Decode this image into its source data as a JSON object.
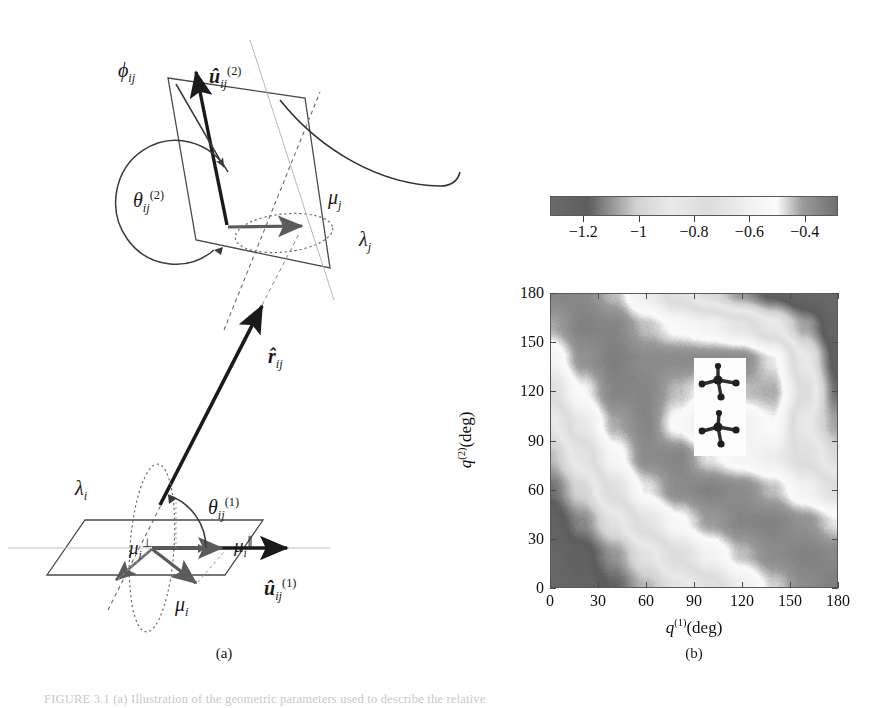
{
  "figure": {
    "panels": [
      {
        "key": "a",
        "label": "(a)",
        "type": "vector-diagram"
      },
      {
        "key": "b",
        "label": "(b)",
        "type": "heatmap"
      }
    ],
    "caption": "FIGURE 3.1  (a) Illustration of the geometric parameters used to describe the relative"
  },
  "panel_a": {
    "label": "(a)",
    "annotations": [
      {
        "name": "phi-ij",
        "text": "ϕ",
        "sub": "ij",
        "sup": "",
        "x": 118,
        "y": 59
      },
      {
        "name": "u-hat-2",
        "text": "û",
        "sub": "ij",
        "sup": "(2)",
        "x": 209,
        "y": 64
      },
      {
        "name": "theta-ij-2",
        "text": "θ",
        "sub": "ij",
        "sup": "(2)",
        "x": 133,
        "y": 188
      },
      {
        "name": "mu-j",
        "text": "μ",
        "sub": "j",
        "sup": "",
        "x": 328,
        "y": 186
      },
      {
        "name": "lambda-j",
        "text": "λ",
        "sub": "j",
        "sup": "",
        "x": 359,
        "y": 228
      },
      {
        "name": "r-hat-ij",
        "text": "r̂",
        "sub": "ij",
        "sup": "",
        "x": 268,
        "y": 345
      },
      {
        "name": "lambda-i",
        "text": "λ",
        "sub": "i",
        "sup": "",
        "x": 75,
        "y": 477
      },
      {
        "name": "theta-ij-1",
        "text": "θ",
        "sub": "ij",
        "sup": "(1)",
        "x": 208,
        "y": 495
      },
      {
        "name": "mu-i-perp",
        "text": "μ",
        "sub": "i",
        "sup": "⊥",
        "x": 129,
        "y": 536
      },
      {
        "name": "mu-i-par",
        "text": "μ",
        "sub": "i",
        "sup": "∥",
        "x": 234,
        "y": 534
      },
      {
        "name": "mu-i",
        "text": "μ",
        "sub": "i",
        "sup": "",
        "x": 175,
        "y": 593
      },
      {
        "name": "u-hat-1",
        "text": "û",
        "sub": "ij",
        "sup": "(1)",
        "x": 264,
        "y": 576
      }
    ]
  },
  "panel_b": {
    "label": "(b)",
    "colorbar": {
      "name": "energy-colorbar",
      "ticks": [
        -1.2,
        -1,
        -0.8,
        -0.6,
        -0.4
      ],
      "tick_labels": [
        "−1.2",
        "−1",
        "−0.8",
        "−0.6",
        "−0.4"
      ],
      "vmin": -1.32,
      "vmax": -0.28,
      "gradient_stops": [
        {
          "pos": 0.0,
          "color": "#6a6a6a"
        },
        {
          "pos": 0.13,
          "color": "#5d5d5d"
        },
        {
          "pos": 0.3,
          "color": "#d2d2d2"
        },
        {
          "pos": 0.42,
          "color": "#eaeaea"
        },
        {
          "pos": 0.55,
          "color": "#dcdcdc"
        },
        {
          "pos": 0.7,
          "color": "#f2f2f2"
        },
        {
          "pos": 0.79,
          "color": "#fbfbfb"
        },
        {
          "pos": 0.88,
          "color": "#9a9a9a"
        },
        {
          "pos": 1.0,
          "color": "#707070"
        }
      ]
    },
    "axes": {
      "x_label_base": "q",
      "x_label_sup": "(1)",
      "x_label_unit": "(deg)",
      "y_label_base": "q",
      "y_label_sup": "(2)",
      "y_label_unit": "(deg)",
      "x_ticks": [
        0,
        30,
        60,
        90,
        120,
        150,
        180
      ],
      "y_ticks": [
        0,
        30,
        60,
        90,
        120,
        150,
        180
      ],
      "xlim": [
        0,
        180
      ],
      "ylim": [
        0,
        180
      ]
    },
    "inset": {
      "name": "molecule-pair-inset",
      "description": "two stacked tetrahedral molecules"
    }
  },
  "chart_data": {
    "type": "heatmap",
    "title": "",
    "xlabel": "q(1)(deg)",
    "ylabel": "q(2)(deg)",
    "xlim": [
      0,
      180
    ],
    "ylim": [
      0,
      180
    ],
    "zlim": [
      -1.32,
      -0.28
    ],
    "colorbar_label": "",
    "colorbar_ticks": [
      -1.2,
      -1,
      -0.8,
      -0.6,
      -0.4
    ],
    "grid": false,
    "legend": "none",
    "field": {
      "x": [
        0,
        20,
        40,
        60,
        80,
        100,
        120,
        140,
        160,
        180
      ],
      "y": [
        0,
        20,
        40,
        60,
        80,
        100,
        120,
        140,
        160,
        180
      ],
      "z": [
        [
          -1.3,
          -1.26,
          -1.18,
          -1.05,
          -0.92,
          -0.8,
          -0.62,
          -0.46,
          -0.36,
          -0.32
        ],
        [
          -1.28,
          -1.22,
          -1.1,
          -0.92,
          -0.74,
          -0.58,
          -0.44,
          -0.36,
          -0.33,
          -0.35
        ],
        [
          -1.24,
          -1.12,
          -0.92,
          -0.7,
          -0.52,
          -0.4,
          -0.34,
          -0.33,
          -0.38,
          -0.48
        ],
        [
          -1.16,
          -0.98,
          -0.72,
          -0.48,
          -0.36,
          -0.33,
          -0.36,
          -0.44,
          -0.58,
          -0.74
        ],
        [
          -1.04,
          -0.82,
          -0.54,
          -0.36,
          -0.34,
          -0.48,
          -0.56,
          -0.62,
          -0.78,
          -0.96
        ],
        [
          -0.9,
          -0.66,
          -0.42,
          -0.34,
          -0.52,
          -0.68,
          -0.6,
          -0.5,
          -0.88,
          -1.08
        ],
        [
          -0.74,
          -0.5,
          -0.34,
          -0.34,
          -0.44,
          -0.52,
          -0.44,
          -0.42,
          -0.76,
          -1.16
        ],
        [
          -0.58,
          -0.38,
          -0.32,
          -0.36,
          -0.36,
          -0.36,
          -0.36,
          -0.48,
          -0.88,
          -1.22
        ],
        [
          -0.42,
          -0.33,
          -0.34,
          -0.44,
          -0.52,
          -0.58,
          -0.68,
          -0.86,
          -1.08,
          -1.28
        ],
        [
          -0.34,
          -0.35,
          -0.44,
          -0.62,
          -0.8,
          -0.96,
          -1.1,
          -1.2,
          -1.28,
          -1.31
        ]
      ]
    }
  }
}
